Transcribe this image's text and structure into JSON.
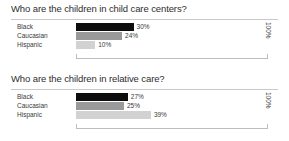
{
  "charts": [
    {
      "title": "Who are the children in child care centers?",
      "axis_max_label": "100%",
      "categories": [
        "Black",
        "Caucasian",
        "Hispanic"
      ],
      "values": [
        30,
        24,
        10
      ],
      "value_labels": [
        "30%",
        "24%",
        "10%"
      ],
      "colors": [
        "#0d0d0d",
        "#9a9a9a",
        "#d2d2d2"
      ]
    },
    {
      "title": "Who are the children in relative care?",
      "axis_max_label": "100%",
      "categories": [
        "Black",
        "Caucasian",
        "Hispanic"
      ],
      "values": [
        27,
        25,
        39
      ],
      "value_labels": [
        "27%",
        "25%",
        "39%"
      ],
      "colors": [
        "#0d0d0d",
        "#9a9a9a",
        "#d2d2d2"
      ]
    }
  ],
  "chart_data": [
    {
      "type": "bar",
      "orientation": "horizontal",
      "title": "Who are the children in child care centers?",
      "categories": [
        "Black",
        "Caucasian",
        "Hispanic"
      ],
      "values": [
        30,
        24,
        10
      ],
      "data_labels": [
        "30%",
        "24%",
        "10%"
      ],
      "xlabel": "",
      "ylabel": "",
      "xlim": [
        0,
        100
      ],
      "axis_max_label": "100%",
      "grid": false,
      "legend": "none",
      "series_colors": [
        "#0d0d0d",
        "#9a9a9a",
        "#d2d2d2"
      ],
      "units": "percent"
    },
    {
      "type": "bar",
      "orientation": "horizontal",
      "title": "Who are the children in relative care?",
      "categories": [
        "Black",
        "Caucasian",
        "Hispanic"
      ],
      "values": [
        27,
        25,
        39
      ],
      "data_labels": [
        "27%",
        "25%",
        "39%"
      ],
      "xlabel": "",
      "ylabel": "",
      "xlim": [
        0,
        100
      ],
      "axis_max_label": "100%",
      "grid": false,
      "legend": "none",
      "series_colors": [
        "#0d0d0d",
        "#9a9a9a",
        "#d2d2d2"
      ],
      "units": "percent"
    }
  ]
}
